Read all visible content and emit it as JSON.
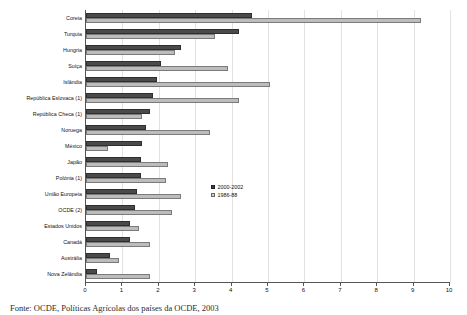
{
  "chart_data": {
    "type": "bar",
    "orientation": "horizontal",
    "title": "",
    "xlabel": "",
    "ylabel": "",
    "xlim": [
      0,
      10
    ],
    "xticks": [
      "0",
      "1",
      "2",
      "3",
      "4",
      "5",
      "6",
      "7",
      "8",
      "9",
      "10"
    ],
    "grid": true,
    "legend_position": "center",
    "categories": [
      "Coreia",
      "Turquia",
      "Hungria",
      "Suíça",
      "Islândia",
      "República Eslovaca (1)",
      "República Checa (1)",
      "Noruega",
      "México",
      "Japão",
      "Polónia (1)",
      "União Europeia",
      "OCDE (2)",
      "Estados Unidos",
      "Canadá",
      "Austrália",
      "Nova Zelândia"
    ],
    "series": [
      {
        "name": "2000-2002",
        "color": "#4a4a4a",
        "values": [
          4.55,
          4.2,
          2.6,
          2.05,
          1.95,
          1.85,
          1.75,
          1.65,
          1.55,
          1.5,
          1.5,
          1.4,
          1.35,
          1.2,
          1.2,
          0.65,
          0.3
        ]
      },
      {
        "name": "1986-88",
        "color": "#bcbcbc",
        "values": [
          9.2,
          3.55,
          2.45,
          3.9,
          5.05,
          4.2,
          1.55,
          3.4,
          0.6,
          2.25,
          2.2,
          2.6,
          2.35,
          1.45,
          1.75,
          0.9,
          1.75
        ]
      }
    ]
  },
  "legend": {
    "items": [
      {
        "label": "2000-2002"
      },
      {
        "label": "1986-88"
      }
    ]
  },
  "source_note": "Fonte: OCDE, Políticas Agrícolas dos países da OCDE, 2003"
}
